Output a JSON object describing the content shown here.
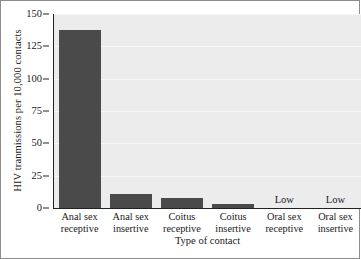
{
  "chart_data": {
    "type": "bar",
    "title": "",
    "xlabel": "Type of contact",
    "ylabel": "HIV tranmissions per 10,000 contacts",
    "categories": [
      "Anal sex receptive",
      "Anal sex insertive",
      "Coitus receptive",
      "Coitus insertive",
      "Oral sex receptive",
      "Oral sex insertive"
    ],
    "category_lines": [
      [
        "Anal sex",
        "receptive"
      ],
      [
        "Anal sex",
        "insertive"
      ],
      [
        "Coitus",
        "receptive"
      ],
      [
        "Coitus",
        "insertive"
      ],
      [
        "Oral sex",
        "receptive"
      ],
      [
        "Oral sex",
        "insertive"
      ]
    ],
    "values": [
      138,
      11,
      8,
      3,
      null,
      null
    ],
    "value_annotations": [
      "",
      "",
      "",
      "",
      "Low",
      "Low"
    ],
    "ylim": [
      0,
      150
    ],
    "yticks": [
      0,
      25,
      50,
      75,
      100,
      125,
      150
    ],
    "grid": true,
    "legend": "none",
    "bar_color": "#4a4a4a",
    "plot_background": "#ececec",
    "gridline_color": "#f7f7f7",
    "axis_color": "#222222"
  }
}
